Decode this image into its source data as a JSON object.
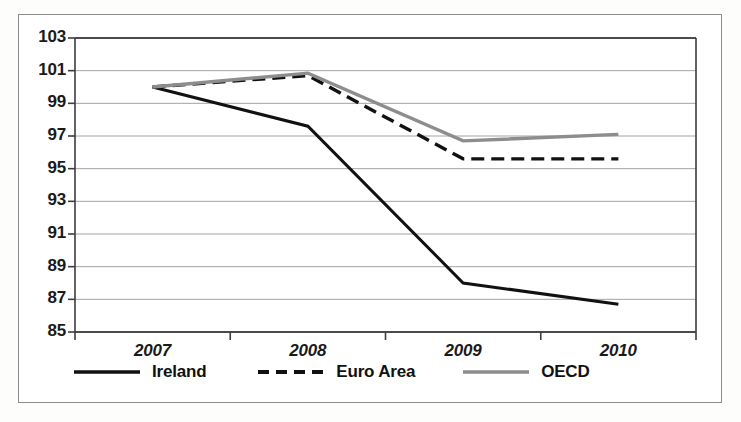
{
  "chart_data": {
    "type": "line",
    "title": "",
    "subtitle": "",
    "xlabel": "",
    "ylabel": "",
    "categories": [
      "2007",
      "2008",
      "2009",
      "2010"
    ],
    "ylim": [
      85,
      103
    ],
    "yticks": [
      85,
      87,
      89,
      91,
      93,
      95,
      97,
      99,
      101,
      103
    ],
    "ytick_labels": [
      "85",
      "87",
      "89",
      "91",
      "93",
      "95",
      "97",
      "99",
      "101",
      "103"
    ],
    "grid": true,
    "grid_axis": "y",
    "legend_position": "bottom",
    "series": [
      {
        "name": "Ireland",
        "values": [
          100.0,
          97.6,
          88.0,
          86.7
        ],
        "color": "#111111",
        "style": "solid",
        "width": 3
      },
      {
        "name": "Euro Area",
        "values": [
          100.0,
          100.7,
          95.6,
          95.6
        ],
        "color": "#111111",
        "style": "dashed",
        "width": 3.4
      },
      {
        "name": "OECD",
        "values": [
          100.0,
          100.85,
          96.7,
          97.1
        ],
        "color": "#8d8d8d",
        "style": "solid",
        "width": 3.4
      }
    ]
  },
  "legend": {
    "items": [
      {
        "label": "Ireland",
        "swatch": "solid-black-line-swatch"
      },
      {
        "label": "Euro Area",
        "swatch": "dashed-black-line-swatch"
      },
      {
        "label": "OECD",
        "swatch": "solid-gray-line-swatch"
      }
    ]
  },
  "axes": {
    "y_axis_name": "value-axis",
    "x_axis_name": "year-axis"
  }
}
